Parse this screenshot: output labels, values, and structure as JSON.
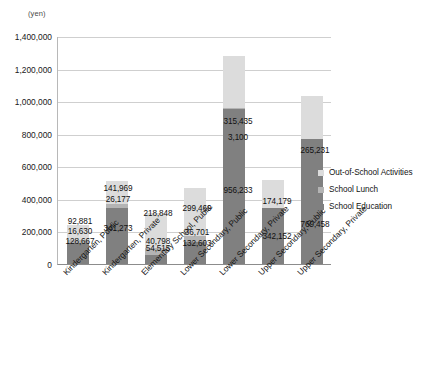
{
  "chart_data": {
    "type": "bar",
    "stacked": true,
    "title": "",
    "subtitle": "",
    "xlabel": "",
    "ylabel": "",
    "unit_caption": "(yen)",
    "ylim": [
      0,
      1400000
    ],
    "ytick_labels": [
      "1,400,000",
      "1,200,000",
      "1,000,000",
      "800,000",
      "600,000",
      "400,000",
      "200,000",
      "0"
    ],
    "ytick_values": [
      1400000,
      1200000,
      1000000,
      800000,
      600000,
      400000,
      200000,
      0
    ],
    "grid": true,
    "legend_position": "right",
    "categories": [
      "Kindergarten, Public",
      "Kindergarten, Private",
      "Elementary School, Public",
      "Lower Secondary, Public",
      "Lower Secondary, Private",
      "Upper Secondary, Public",
      "Upper Secondary, Private"
    ],
    "series": [
      {
        "name": "School Education",
        "color": "#808080",
        "values": [
          128667,
          341273,
          54515,
          132603,
          956233,
          342152,
          769458
        ],
        "labels": [
          "128,667",
          "341,273",
          "54,515",
          "132,603",
          "956,233",
          "342,152",
          "769,458"
        ]
      },
      {
        "name": "School Lunch",
        "color": "#b4b4b4",
        "values": [
          16630,
          26177,
          40798,
          36701,
          3100,
          0,
          0
        ],
        "labels": [
          "16,630",
          "26,177",
          "40,798",
          "36,701",
          "3,100",
          "",
          ""
        ]
      },
      {
        "name": "Out-of-School Activities",
        "color": "#dcdcdc",
        "values": [
          92881,
          141969,
          218848,
          299469,
          315435,
          174179,
          265231
        ],
        "labels": [
          "92,881",
          "141,969",
          "218,848",
          "299,469",
          "315,435",
          "174,179",
          "265,231"
        ]
      }
    ],
    "totals": [
      238178,
      509419,
      314161,
      468773,
      1274768,
      516331,
      1034689
    ]
  },
  "legend": {
    "entries": [
      {
        "label": "Out-of-School Activities",
        "swatch": "out"
      },
      {
        "label": "School Lunch",
        "swatch": "lunch"
      },
      {
        "label": "School Education",
        "swatch": "edu"
      }
    ]
  }
}
